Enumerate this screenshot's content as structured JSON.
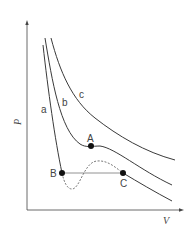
{
  "diagram": {
    "axes": {
      "x_label": "V",
      "y_label": "P"
    },
    "curves": [
      {
        "id": "a",
        "label": "a"
      },
      {
        "id": "b",
        "label": "b"
      },
      {
        "id": "c",
        "label": "c"
      }
    ],
    "points": [
      {
        "id": "A",
        "label": "A"
      },
      {
        "id": "B",
        "label": "B"
      },
      {
        "id": "C",
        "label": "C"
      }
    ],
    "colors": {
      "line": "#3a3a3a",
      "tie_line": "#777777",
      "dashed": "#555555",
      "point": "#111111"
    }
  }
}
